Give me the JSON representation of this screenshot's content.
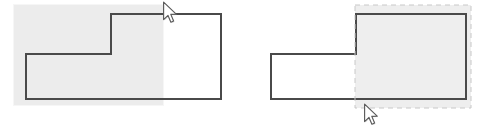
{
  "scene": {
    "width": 490,
    "height": 128,
    "background": "#ffffff",
    "description": "Two side-by-side illustrations of an L-shaped polygon with a rectangular selection region"
  },
  "colors": {
    "shape_stroke": "#4a4a4a",
    "shape_fill": "#ffffff",
    "selection_fill": "#ececec",
    "selection_fill_right": "#eeeeee",
    "marquee_dash_stroke": "#c8c8c8",
    "cursor_fill": "#ffffff",
    "cursor_stroke": "#5a5a5a",
    "background": "#ffffff"
  },
  "panels": [
    {
      "id": "left-panel",
      "name": "drag-selection-panel",
      "label": "",
      "shape": {
        "name": "l-shaped-polygon",
        "stroke_width": 2,
        "points": [
          [
            111,
            14
          ],
          [
            221,
            14
          ],
          [
            221,
            99
          ],
          [
            26,
            99
          ],
          [
            26,
            54
          ],
          [
            111,
            54
          ]
        ]
      },
      "selection": {
        "name": "selection-highlight-rect",
        "style": "solid-fill",
        "x": 14,
        "y": 5,
        "width": 149,
        "height": 100,
        "fill": "#ececec"
      },
      "cursor": {
        "name": "mouse-pointer",
        "x": 162,
        "y": 1,
        "type": "arrow"
      }
    },
    {
      "id": "right-panel",
      "name": "marquee-result-panel",
      "label": "",
      "shape": {
        "name": "l-shaped-polygon",
        "stroke_width": 2,
        "points": [
          [
            111,
            14
          ],
          [
            221,
            14
          ],
          [
            221,
            99
          ],
          [
            26,
            99
          ],
          [
            26,
            54
          ],
          [
            111,
            54
          ]
        ]
      },
      "selection": {
        "name": "selection-marquee-rect",
        "style": "dashed-outline",
        "x": 110,
        "y": 5,
        "width": 116,
        "height": 103,
        "fill": "#eeeeee",
        "dash": "5 4"
      },
      "cursor": {
        "name": "mouse-pointer",
        "x": 118,
        "y": 103,
        "type": "arrow"
      }
    }
  ]
}
